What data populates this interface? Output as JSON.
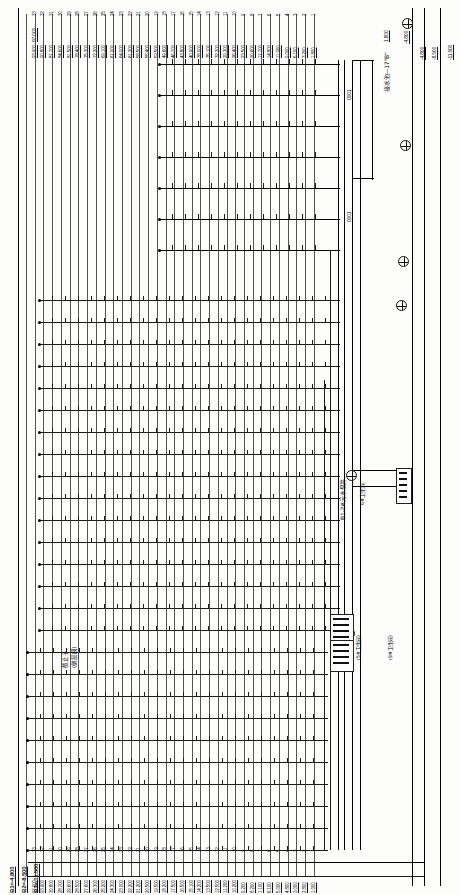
{
  "document": {
    "type": "plumbing-riser-diagram",
    "orientation": "rotated-90",
    "sheet_background": "#fdfdfc",
    "line_color": "#1d1d1d"
  },
  "elevations": {
    "unit": "m",
    "header_top": "97.000",
    "items": [
      {
        "floor": "33",
        "value": "93.900"
      },
      {
        "floor": "32",
        "value": "90.800"
      },
      {
        "floor": "31",
        "value": "87.700"
      },
      {
        "floor": "30",
        "value": "84.600"
      },
      {
        "floor": "29",
        "value": "81.500"
      },
      {
        "floor": "28",
        "value": "78.400"
      },
      {
        "floor": "27",
        "value": "75.300"
      },
      {
        "floor": "26",
        "value": "72.200"
      },
      {
        "floor": "25",
        "value": "69.100"
      },
      {
        "floor": "24",
        "value": "67.000"
      },
      {
        "floor": "23",
        "value": "64.000"
      },
      {
        "floor": "22",
        "value": "61.200"
      },
      {
        "floor": "21",
        "value": "58.500"
      },
      {
        "floor": "20",
        "value": "55.400"
      },
      {
        "floor": "19",
        "value": "52.500"
      },
      {
        "floor": "18",
        "value": "49.600"
      },
      {
        "floor": "17",
        "value": "46.700"
      },
      {
        "floor": "16",
        "value": "43.800"
      },
      {
        "floor": "15",
        "value": "40.900"
      },
      {
        "floor": "14",
        "value": "38.000"
      },
      {
        "floor": "13",
        "value": "35.100"
      },
      {
        "floor": "12",
        "value": "32.200"
      },
      {
        "floor": "11",
        "value": "29.300"
      },
      {
        "floor": "10",
        "value": "26.400"
      },
      {
        "floor": "9",
        "value": "23.500"
      },
      {
        "floor": "8",
        "value": "20.600"
      },
      {
        "floor": "7",
        "value": "17.700"
      },
      {
        "floor": "6",
        "value": "14.800"
      },
      {
        "floor": "5",
        "value": "11.900"
      },
      {
        "floor": "4",
        "value": "9.000"
      },
      {
        "floor": "3",
        "value": "6.100"
      },
      {
        "floor": "2",
        "value": "3.200"
      },
      {
        "floor": "1",
        "value": "1.800"
      }
    ]
  },
  "bottom_elevations": {
    "items": [
      {
        "floor": "33",
        "value": "97.000"
      },
      {
        "floor": "32",
        "value": "93.900"
      },
      {
        "floor": "31",
        "value": "30.800"
      },
      {
        "floor": "30",
        "value": "28.700"
      },
      {
        "floor": "29",
        "value": "29.600"
      },
      {
        "floor": "28",
        "value": "28.500"
      },
      {
        "floor": "27",
        "value": "27.600"
      },
      {
        "floor": "26",
        "value": "26.300"
      },
      {
        "floor": "25",
        "value": "25.200"
      },
      {
        "floor": "24",
        "value": "24.300"
      },
      {
        "floor": "23",
        "value": "23.000"
      },
      {
        "floor": "22",
        "value": "22.200"
      },
      {
        "floor": "21",
        "value": "21.200"
      },
      {
        "floor": "20",
        "value": "20.500"
      },
      {
        "floor": "19",
        "value": "19.500"
      },
      {
        "floor": "18",
        "value": "18.200"
      },
      {
        "floor": "17",
        "value": "17.500"
      },
      {
        "floor": "16",
        "value": "16.500"
      },
      {
        "floor": "15",
        "value": "15.100"
      },
      {
        "floor": "14",
        "value": "14.200"
      },
      {
        "floor": "13",
        "value": "13.500"
      },
      {
        "floor": "12",
        "value": "12.500"
      },
      {
        "floor": "11",
        "value": "11.200"
      },
      {
        "floor": "10",
        "value": "10.200"
      },
      {
        "floor": "9",
        "value": "9.200"
      },
      {
        "floor": "8",
        "value": "8.200"
      },
      {
        "floor": "7",
        "value": "7.100"
      },
      {
        "floor": "6",
        "value": "6.100"
      },
      {
        "floor": "5",
        "value": "5.000"
      },
      {
        "floor": "4",
        "value": "4.800"
      },
      {
        "floor": "3",
        "value": "3.000"
      },
      {
        "floor": "2",
        "value": "2.800"
      },
      {
        "floor": "1",
        "value": "1.000"
      }
    ]
  },
  "basement_levels": [
    {
      "label": "B1",
      "value": "-4.800"
    },
    {
      "label": "B2",
      "value": "-8.500"
    },
    {
      "label": "B3",
      "value": "-11.500"
    }
  ],
  "right_levels": [
    {
      "value": "-4.800",
      "tag": "B1"
    },
    {
      "value": "-8.500",
      "tag": "B2"
    },
    {
      "value": "-11.500",
      "tag": "B3"
    }
  ],
  "annotations": {
    "tank": "接水池—17\"B\"",
    "tank_level": "-4.800",
    "pump_pit": "B1-2#污水泵井",
    "washroom_6": "6#卫生间",
    "washroom_5": "(5#卫生间)",
    "washroom_9": "(9#卫生间)",
    "valve_note_1": "截止子",
    "valve_note_2": "(倒层阀)",
    "riser_code_a": "0001",
    "riser_code_b": "0001",
    "top_elev": "97.000",
    "level_1800": "1.800"
  },
  "riser_callouts": [
    "0001",
    "0001"
  ],
  "chart_data": {
    "type": "table",
    "columns": [
      "Floor",
      "Elevation (m)"
    ],
    "rows": [
      [
        "33",
        "93.900"
      ],
      [
        "32",
        "90.800"
      ],
      [
        "31",
        "87.700"
      ],
      [
        "30",
        "84.600"
      ],
      [
        "29",
        "81.500"
      ],
      [
        "28",
        "78.400"
      ],
      [
        "27",
        "75.300"
      ],
      [
        "26",
        "72.200"
      ],
      [
        "25",
        "69.100"
      ],
      [
        "24",
        "67.000"
      ],
      [
        "23",
        "64.000"
      ],
      [
        "22",
        "61.200"
      ],
      [
        "21",
        "58.500"
      ],
      [
        "20",
        "55.400"
      ],
      [
        "19",
        "52.500"
      ],
      [
        "18",
        "49.600"
      ],
      [
        "17",
        "46.700"
      ],
      [
        "16",
        "43.800"
      ],
      [
        "15",
        "40.900"
      ],
      [
        "14",
        "38.000"
      ],
      [
        "13",
        "35.100"
      ],
      [
        "12",
        "32.200"
      ],
      [
        "11",
        "29.300"
      ],
      [
        "10",
        "26.400"
      ],
      [
        "9",
        "23.500"
      ],
      [
        "8",
        "20.600"
      ],
      [
        "7",
        "17.700"
      ],
      [
        "6",
        "14.800"
      ],
      [
        "5",
        "11.900"
      ],
      [
        "4",
        "9.000"
      ],
      [
        "3",
        "6.100"
      ],
      [
        "2",
        "3.200"
      ],
      [
        "1",
        "1.800"
      ],
      [
        "B1",
        "-4.800"
      ],
      [
        "B2",
        "-8.500"
      ],
      [
        "B3",
        "-11.500"
      ]
    ]
  }
}
